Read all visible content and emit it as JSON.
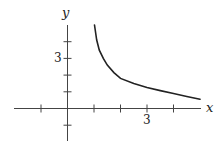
{
  "chart_data": {
    "type": "line",
    "title": "",
    "xlabel": "x",
    "ylabel": "y",
    "xlim": [
      -2.0,
      5.0
    ],
    "ylim": [
      -1.9,
      5.0
    ],
    "grid": false,
    "legend": null,
    "x_ticks": [
      -1,
      0,
      1,
      2,
      3,
      4
    ],
    "y_ticks": [
      -1,
      0,
      1,
      2,
      3,
      4
    ],
    "x_tick_labels": [
      {
        "value": 3,
        "label": "3"
      }
    ],
    "y_tick_labels": [
      {
        "value": 3,
        "label": "3"
      }
    ],
    "series": [
      {
        "name": "curve",
        "color": "#222222",
        "x": [
          1.02,
          1.1,
          1.2,
          1.35,
          1.5,
          1.75,
          2.0,
          2.5,
          3.0,
          3.5,
          4.0,
          4.5,
          5.0
        ],
        "y": [
          5.0,
          4.1,
          3.5,
          3.0,
          2.6,
          2.15,
          1.8,
          1.5,
          1.26,
          1.07,
          0.9,
          0.72,
          0.55
        ]
      }
    ]
  },
  "labels": {
    "x_axis": "x",
    "y_axis": "y",
    "x_tick_3": "3",
    "y_tick_3": "3"
  }
}
